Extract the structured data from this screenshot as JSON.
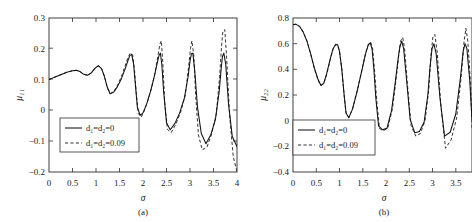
{
  "figure": {
    "background": "#ffffff",
    "axis_color": "#2b2b2b",
    "solid_color": "#101010",
    "dashed_color": "#282828"
  },
  "chart_data": [
    {
      "type": "line",
      "panel": "a",
      "caption": "(a)",
      "title": "",
      "xlabel": "σ",
      "ylabel": "μ₁₁",
      "xlim": [
        0,
        4
      ],
      "ylim": [
        -0.2,
        0.3
      ],
      "xticks": [
        0,
        0.5,
        1,
        1.5,
        2,
        2.5,
        3,
        3.5,
        4
      ],
      "xticklabels": [
        "0",
        "0.5",
        "1",
        "1.5",
        "2",
        "2.5",
        "3",
        "3.5",
        "4"
      ],
      "yticks": [
        -0.2,
        -0.1,
        0,
        0.1,
        0.2,
        0.3
      ],
      "yticklabels": [
        "−0.2",
        "−0.1",
        "0",
        "0.1",
        "0.2",
        "0.3"
      ],
      "grid": false,
      "legend_position": "lower-left",
      "legend": [
        "d₁=d₂=0",
        "d₁=d₂=0.09"
      ],
      "series": [
        {
          "name": "d₁=d₂=0",
          "style": "solid",
          "x": [
            0.0,
            0.12,
            0.25,
            0.38,
            0.5,
            0.58,
            0.66,
            0.74,
            0.82,
            0.9,
            0.98,
            1.05,
            1.12,
            1.18,
            1.24,
            1.3,
            1.38,
            1.46,
            1.54,
            1.62,
            1.68,
            1.72,
            1.76,
            1.8,
            1.84,
            1.88,
            1.94,
            2.0,
            2.08,
            2.16,
            2.24,
            2.3,
            2.34,
            2.37,
            2.4,
            2.44,
            2.5,
            2.58,
            2.68,
            2.78,
            2.88,
            2.96,
            3.0,
            3.03,
            3.06,
            3.1,
            3.16,
            3.24,
            3.34,
            3.44,
            3.54,
            3.62,
            3.66,
            3.69,
            3.72,
            3.76,
            3.82,
            3.9,
            4.0
          ],
          "y": [
            0.1,
            0.108,
            0.116,
            0.124,
            0.129,
            0.13,
            0.126,
            0.117,
            0.114,
            0.122,
            0.137,
            0.145,
            0.135,
            0.11,
            0.075,
            0.054,
            0.06,
            0.078,
            0.103,
            0.135,
            0.162,
            0.178,
            0.182,
            0.15,
            0.08,
            0.01,
            -0.016,
            -0.008,
            0.022,
            0.062,
            0.11,
            0.152,
            0.178,
            0.186,
            0.15,
            0.06,
            -0.04,
            -0.063,
            -0.042,
            -0.008,
            0.04,
            0.11,
            0.16,
            0.184,
            0.186,
            0.13,
            0.01,
            -0.075,
            -0.108,
            -0.08,
            -0.03,
            0.06,
            0.13,
            0.175,
            0.186,
            0.15,
            0.02,
            -0.085,
            -0.118
          ],
          "n_points": 59
        },
        {
          "name": "d₁=d₂=0.09",
          "style": "dashed",
          "x": [
            0.0,
            0.12,
            0.25,
            0.38,
            0.5,
            0.58,
            0.66,
            0.74,
            0.82,
            0.9,
            0.98,
            1.05,
            1.12,
            1.18,
            1.24,
            1.3,
            1.38,
            1.46,
            1.54,
            1.62,
            1.68,
            1.73,
            1.78,
            1.82,
            1.86,
            1.9,
            1.96,
            2.02,
            2.1,
            2.18,
            2.26,
            2.32,
            2.36,
            2.39,
            2.42,
            2.46,
            2.52,
            2.6,
            2.7,
            2.8,
            2.9,
            2.97,
            3.01,
            3.04,
            3.08,
            3.12,
            3.18,
            3.26,
            3.36,
            3.46,
            3.56,
            3.63,
            3.67,
            3.7,
            3.74,
            3.78,
            3.84,
            3.92,
            4.0
          ],
          "y": [
            0.1,
            0.108,
            0.116,
            0.124,
            0.129,
            0.13,
            0.126,
            0.117,
            0.114,
            0.122,
            0.137,
            0.145,
            0.135,
            0.11,
            0.075,
            0.054,
            0.062,
            0.082,
            0.11,
            0.145,
            0.172,
            0.186,
            0.18,
            0.13,
            0.05,
            -0.01,
            -0.022,
            -0.004,
            0.03,
            0.072,
            0.125,
            0.18,
            0.215,
            0.226,
            0.16,
            0.03,
            -0.062,
            -0.072,
            -0.045,
            -0.006,
            0.05,
            0.14,
            0.2,
            0.226,
            0.18,
            0.05,
            -0.08,
            -0.128,
            -0.12,
            -0.076,
            -0.012,
            0.11,
            0.205,
            0.258,
            0.262,
            0.17,
            -0.01,
            -0.15,
            -0.2
          ],
          "n_points": 59
        }
      ]
    },
    {
      "type": "line",
      "panel": "b",
      "caption": "(b)",
      "title": "",
      "xlabel": "σ",
      "ylabel": "μ₂₂",
      "xlim": [
        0,
        3.85
      ],
      "ylim": [
        -0.4,
        0.8
      ],
      "xticks": [
        0,
        0.5,
        1,
        1.5,
        2,
        2.5,
        3,
        3.5
      ],
      "xticklabels": [
        "0",
        "0.5",
        "1",
        "1.5",
        "2",
        "2.5",
        "3",
        "3.5"
      ],
      "yticks": [
        -0.4,
        -0.2,
        0,
        0.2,
        0.4,
        0.6,
        0.8
      ],
      "yticklabels": [
        "−0.4",
        "−0.2",
        "0",
        "0.2",
        "0.4",
        "0.6",
        "0.8"
      ],
      "grid": false,
      "legend_position": "lower-left",
      "legend": [
        "d₁=d₂=0",
        "d₁=d₂=0.09"
      ],
      "series": [
        {
          "name": "d₁=d₂=0",
          "style": "solid",
          "x": [
            0.0,
            0.06,
            0.14,
            0.22,
            0.3,
            0.38,
            0.46,
            0.54,
            0.6,
            0.66,
            0.72,
            0.8,
            0.86,
            0.92,
            0.96,
            1.0,
            1.05,
            1.1,
            1.14,
            1.2,
            1.28,
            1.38,
            1.48,
            1.56,
            1.62,
            1.66,
            1.7,
            1.74,
            1.78,
            1.84,
            1.92,
            2.02,
            2.12,
            2.2,
            2.26,
            2.3,
            2.34,
            2.38,
            2.44,
            2.52,
            2.62,
            2.72,
            2.82,
            2.9,
            2.95,
            2.99,
            3.03,
            3.08,
            3.16,
            3.26,
            3.38,
            3.5,
            3.6,
            3.66,
            3.7,
            3.74,
            3.8,
            3.85
          ],
          "y": [
            0.748,
            0.752,
            0.735,
            0.69,
            0.62,
            0.52,
            0.41,
            0.32,
            0.276,
            0.29,
            0.36,
            0.48,
            0.56,
            0.596,
            0.592,
            0.54,
            0.4,
            0.2,
            0.06,
            0.022,
            0.09,
            0.23,
            0.39,
            0.52,
            0.59,
            0.606,
            0.56,
            0.4,
            0.18,
            -0.04,
            -0.07,
            -0.06,
            0.08,
            0.3,
            0.48,
            0.58,
            0.62,
            0.56,
            0.33,
            0.01,
            -0.095,
            -0.085,
            -0.01,
            0.2,
            0.43,
            0.56,
            0.6,
            0.52,
            0.18,
            -0.12,
            -0.09,
            0.05,
            0.33,
            0.54,
            0.6,
            0.56,
            0.32,
            0.01
          ],
          "n_points": 58
        },
        {
          "name": "d₁=d₂=0.09",
          "style": "dashed",
          "x": [
            0.0,
            0.06,
            0.14,
            0.22,
            0.3,
            0.38,
            0.46,
            0.54,
            0.6,
            0.66,
            0.72,
            0.8,
            0.86,
            0.92,
            0.96,
            1.0,
            1.05,
            1.1,
            1.14,
            1.2,
            1.28,
            1.38,
            1.48,
            1.56,
            1.62,
            1.67,
            1.71,
            1.75,
            1.8,
            1.86,
            1.94,
            2.04,
            2.14,
            2.22,
            2.28,
            2.32,
            2.36,
            2.4,
            2.46,
            2.54,
            2.64,
            2.74,
            2.84,
            2.92,
            2.97,
            3.01,
            3.05,
            3.1,
            3.18,
            3.28,
            3.4,
            3.52,
            3.62,
            3.68,
            3.72,
            3.76,
            3.82,
            3.85
          ],
          "y": [
            0.748,
            0.752,
            0.735,
            0.69,
            0.62,
            0.52,
            0.405,
            0.315,
            0.272,
            0.288,
            0.355,
            0.475,
            0.555,
            0.592,
            0.59,
            0.54,
            0.4,
            0.2,
            0.06,
            0.025,
            0.092,
            0.232,
            0.392,
            0.525,
            0.595,
            0.612,
            0.57,
            0.41,
            0.16,
            -0.06,
            -0.08,
            -0.055,
            0.095,
            0.33,
            0.53,
            0.625,
            0.648,
            0.56,
            0.29,
            -0.04,
            -0.12,
            -0.1,
            0.0,
            0.24,
            0.52,
            0.655,
            0.672,
            0.54,
            0.12,
            -0.215,
            -0.15,
            0.02,
            0.35,
            0.62,
            0.72,
            0.62,
            0.28,
            -0.06
          ],
          "n_points": 58
        }
      ]
    }
  ]
}
